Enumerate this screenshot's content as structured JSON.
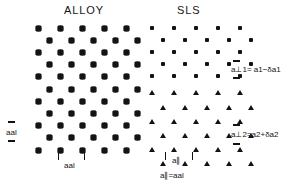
{
  "figure": {
    "panels": [
      {
        "id": "alloy",
        "title": "ALLOY"
      },
      {
        "id": "sls",
        "title": "SLS"
      }
    ]
  },
  "annotations": {
    "a_perp_1": "a⊥1= a1−δa1",
    "a_perp_2": "a⊥2=a2+δa2",
    "a_al_vertical": "aal",
    "a_al_horizontal": "aal",
    "a_parallel": "a∥",
    "a_parallel_eq": "a∥=aal"
  },
  "chart_data": {
    "type": "scatter",
    "xlabel": "",
    "ylabel": "",
    "grid": false,
    "legend": "none",
    "markers": {
      "alloy": "diamond",
      "sls_upper": "dot",
      "sls_lower": "triangle"
    },
    "colors": {
      "marker": "#131313",
      "background": "#ffffff",
      "text": "#161616"
    },
    "series": [
      {
        "name": "ALLOY lattice",
        "marker": "diamond",
        "rows": 11,
        "columns": 5,
        "row_spacing": 12.2,
        "column_spacing": 22.0,
        "stagger": 11.0,
        "origin": [
          38,
          28
        ]
      },
      {
        "name": "SLS layer 1 (a⊥1)",
        "marker": "dot",
        "rows": 5,
        "columns": 5,
        "row_spacing": 12.0,
        "column_spacing": 22.0,
        "stagger": 11.0,
        "origin": [
          152,
          28
        ]
      },
      {
        "name": "SLS layer 2 (a⊥2)",
        "marker": "triangle",
        "rows": 6,
        "columns": 5,
        "row_spacing": 14.2,
        "column_spacing": 22.0,
        "stagger": 11.0,
        "origin": [
          152,
          93
        ]
      }
    ]
  }
}
